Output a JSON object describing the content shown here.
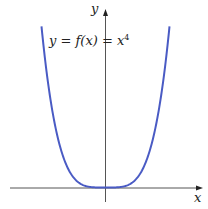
{
  "chart_data": {
    "type": "line",
    "title": "",
    "function_label": "y = f(x) = x⁴",
    "function_label_parts": {
      "lhs": "y = f(x) = ",
      "base": "x",
      "exp": "4"
    },
    "xlabel": "x",
    "ylabel": "y",
    "xlim": [
      -1.4,
      1.4
    ],
    "ylim": [
      0,
      3.84
    ],
    "grid": false,
    "legend": "none",
    "series": [
      {
        "name": "x^4",
        "color": "#4a5bc4",
        "x": [
          -1.4,
          -1.3,
          -1.2,
          -1.1,
          -1.0,
          -0.9,
          -0.8,
          -0.7,
          -0.6,
          -0.5,
          -0.4,
          -0.3,
          -0.2,
          -0.1,
          0,
          0.1,
          0.2,
          0.3,
          0.4,
          0.5,
          0.6,
          0.7,
          0.8,
          0.9,
          1.0,
          1.1,
          1.2,
          1.3,
          1.4
        ],
        "y": [
          3.8416,
          2.8561,
          2.0736,
          1.4641,
          1.0,
          0.6561,
          0.4096,
          0.2401,
          0.1296,
          0.0625,
          0.0256,
          0.0081,
          0.0016,
          0.0001,
          0,
          0.0001,
          0.0016,
          0.0081,
          0.0256,
          0.0625,
          0.1296,
          0.2401,
          0.4096,
          0.6561,
          1.0,
          1.4641,
          2.0736,
          2.8561,
          3.8416
        ]
      }
    ],
    "axes": {
      "color": "#555555",
      "arrows": true
    }
  }
}
